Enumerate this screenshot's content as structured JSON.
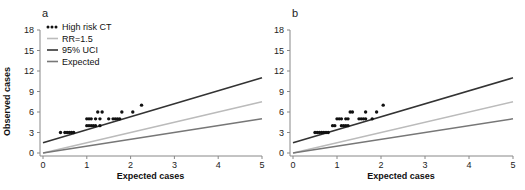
{
  "chart_data": [
    {
      "type": "scatter",
      "panel_label": "a",
      "xlabel": "Expected cases",
      "ylabel": "Observed cases",
      "xlim": [
        0,
        5
      ],
      "ylim": [
        0,
        18
      ],
      "xticks": [
        0,
        1,
        2,
        3,
        4,
        5
      ],
      "yticks": [
        0,
        3,
        6,
        9,
        12,
        15,
        18
      ],
      "grid": false,
      "legend_position": "upper-left",
      "legend": [
        "High risk CT",
        "RR=1.5",
        "95% UCI",
        "Expected"
      ],
      "series": [
        {
          "name": "High risk CT",
          "kind": "points",
          "color": "#111111",
          "points": [
            [
              0.4,
              3
            ],
            [
              0.5,
              3
            ],
            [
              0.55,
              3
            ],
            [
              0.6,
              3
            ],
            [
              0.65,
              3
            ],
            [
              0.7,
              3
            ],
            [
              1.0,
              4
            ],
            [
              1.05,
              4
            ],
            [
              1.1,
              4
            ],
            [
              1.15,
              4
            ],
            [
              1.2,
              4
            ],
            [
              1.3,
              4
            ],
            [
              1.0,
              5
            ],
            [
              1.05,
              5
            ],
            [
              1.1,
              5
            ],
            [
              1.2,
              5
            ],
            [
              1.3,
              5
            ],
            [
              1.5,
              5
            ],
            [
              1.6,
              5
            ],
            [
              1.65,
              5
            ],
            [
              1.7,
              5
            ],
            [
              1.75,
              5
            ],
            [
              1.25,
              6
            ],
            [
              1.35,
              6
            ],
            [
              1.8,
              6
            ],
            [
              2.05,
              6
            ],
            [
              2.25,
              7
            ]
          ]
        },
        {
          "name": "RR=1.5",
          "kind": "line",
          "color": "#bbbbbb",
          "x": [
            0,
            5
          ],
          "y": [
            0,
            7.5
          ]
        },
        {
          "name": "95% UCI",
          "kind": "line",
          "color": "#333333",
          "x": [
            0,
            5
          ],
          "y": [
            1.5,
            11
          ]
        },
        {
          "name": "Expected",
          "kind": "line",
          "color": "#777777",
          "x": [
            0,
            5
          ],
          "y": [
            0,
            5
          ]
        }
      ]
    },
    {
      "type": "scatter",
      "panel_label": "b",
      "xlabel": "Expected cases",
      "ylabel": "",
      "xlim": [
        0,
        5
      ],
      "ylim": [
        0,
        18
      ],
      "xticks": [
        0,
        1,
        2,
        3,
        4,
        5
      ],
      "yticks": [
        0,
        3,
        6,
        9,
        12,
        15,
        18
      ],
      "grid": false,
      "series": [
        {
          "name": "High risk CT",
          "kind": "points",
          "color": "#111111",
          "points": [
            [
              0.5,
              3
            ],
            [
              0.55,
              3
            ],
            [
              0.6,
              3
            ],
            [
              0.65,
              3
            ],
            [
              0.7,
              3
            ],
            [
              0.75,
              3
            ],
            [
              0.8,
              3
            ],
            [
              0.9,
              4
            ],
            [
              0.95,
              4
            ],
            [
              1.1,
              4
            ],
            [
              1.15,
              4
            ],
            [
              1.2,
              4
            ],
            [
              1.25,
              4
            ],
            [
              1.0,
              5
            ],
            [
              1.05,
              5
            ],
            [
              1.1,
              5
            ],
            [
              1.2,
              5
            ],
            [
              1.25,
              5
            ],
            [
              1.5,
              5
            ],
            [
              1.55,
              5
            ],
            [
              1.6,
              5
            ],
            [
              1.65,
              5
            ],
            [
              1.8,
              5
            ],
            [
              1.3,
              6
            ],
            [
              1.35,
              6
            ],
            [
              1.65,
              6
            ],
            [
              1.9,
              6
            ],
            [
              2.05,
              7
            ]
          ]
        },
        {
          "name": "RR=1.5",
          "kind": "line",
          "color": "#bbbbbb",
          "x": [
            0,
            5
          ],
          "y": [
            0,
            7.5
          ]
        },
        {
          "name": "95% UCI",
          "kind": "line",
          "color": "#333333",
          "x": [
            0,
            5
          ],
          "y": [
            1.5,
            11
          ]
        },
        {
          "name": "Expected",
          "kind": "line",
          "color": "#777777",
          "x": [
            0,
            5
          ],
          "y": [
            0,
            5
          ]
        }
      ]
    }
  ],
  "panels": {
    "a": {
      "label": "a",
      "xlabel": "Expected cases",
      "ylabel": "Observed cases"
    },
    "b": {
      "label": "b",
      "xlabel": "Expected cases"
    }
  },
  "legend": {
    "items": [
      {
        "label": "High risk CT",
        "color": "#111111",
        "kind": "dots"
      },
      {
        "label": "RR=1.5",
        "color": "#bbbbbb",
        "kind": "line"
      },
      {
        "label": "95% UCI",
        "color": "#333333",
        "kind": "line"
      },
      {
        "label": "Expected",
        "color": "#777777",
        "kind": "line"
      }
    ]
  }
}
